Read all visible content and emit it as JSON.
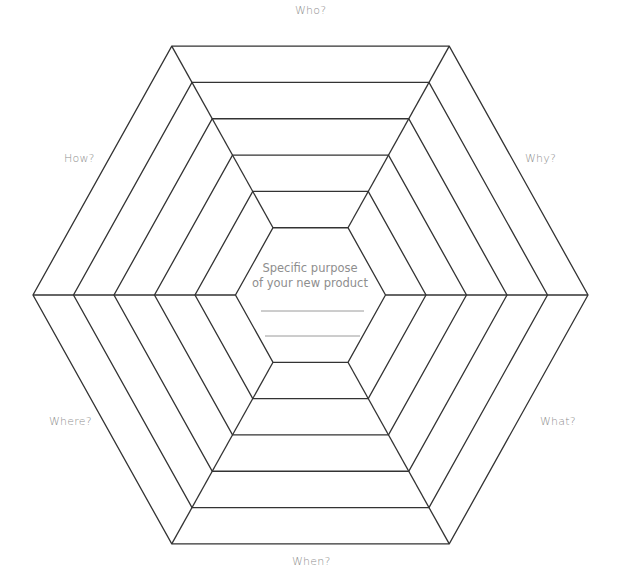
{
  "diagram": {
    "rings": 5,
    "center": {
      "line1": "Specific purpose",
      "line2": "of your new product",
      "answer_lines": 2
    },
    "labels": {
      "top": "Who?",
      "top_right": "Why?",
      "bottom_right": "What?",
      "bottom": "When?",
      "bottom_left": "Where?",
      "top_left": "How?"
    },
    "colors": {
      "line": "#333333",
      "text": "#8e8e8e",
      "answer_line": "#9a9a9a"
    }
  }
}
